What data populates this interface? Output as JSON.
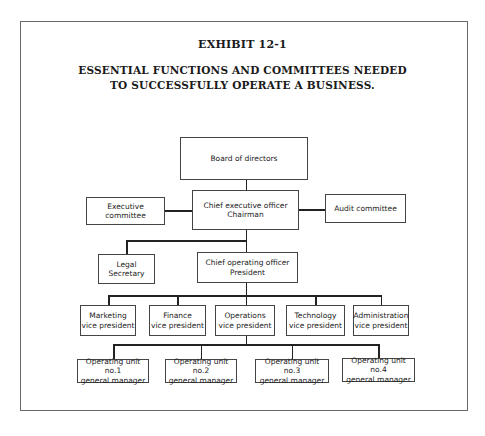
{
  "exhibit": {
    "label": "EXHIBIT 12-1",
    "title_line1": "ESSENTIAL FUNCTIONS AND COMMITTEES NEEDED",
    "title_line2": "TO SUCCESSFULLY OPERATE A BUSINESS."
  },
  "chart": {
    "board": "Board of directors",
    "ceo": "Chief executive officer\nChairman",
    "executive_committee": "Executive committee",
    "audit_committee": "Audit committee",
    "legal": "Legal\nSecretary",
    "coo": "Chief operating officer\nPresident",
    "vps": [
      "Marketing\nvice president",
      "Finance\nvice president",
      "Operations\nvice president",
      "Technology\nvice president",
      "Administration\nvice president"
    ],
    "units": [
      "Operating unit no.1\ngeneral manager",
      "Operating unit no.2\ngeneral manager",
      "Operating unit no.3\ngeneral manager",
      "Operating unit no.4\ngeneral manager"
    ]
  }
}
